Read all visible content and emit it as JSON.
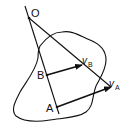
{
  "diagram": {
    "type": "rigid body kinematics - instantaneous center",
    "colors": {
      "stroke": "#111111",
      "background": "#ffffff"
    },
    "points": {
      "O": {
        "label": "O"
      },
      "A": {
        "label": "A"
      },
      "B": {
        "label": "B"
      }
    },
    "vectors": {
      "vB": {
        "label": "v",
        "subscript": "B"
      },
      "vA": {
        "label": "v",
        "subscript": "A"
      }
    }
  }
}
